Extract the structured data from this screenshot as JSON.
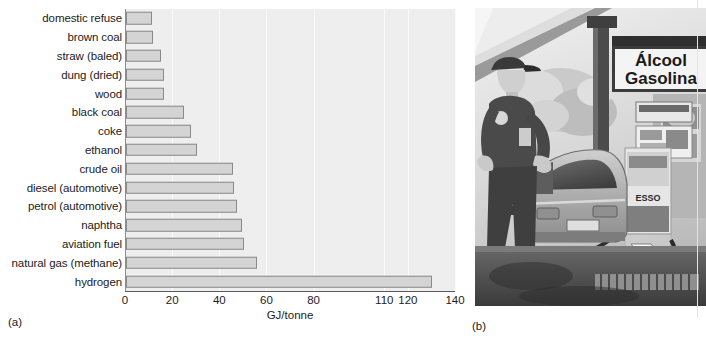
{
  "figure": {
    "panel_a_label": "(a)",
    "panel_b_label": "(b)"
  },
  "chart_data": {
    "type": "bar",
    "orientation": "horizontal",
    "title": "",
    "xlabel": "GJ/tonne",
    "ylabel": "",
    "xlim": [
      0,
      140
    ],
    "xticks": [
      0,
      20,
      40,
      60,
      80,
      110,
      120,
      140
    ],
    "xticklabels": [
      "0",
      "20",
      "40",
      "60",
      "80",
      "110",
      "120",
      "140"
    ],
    "grid": "vertical",
    "legend": "none",
    "bar_facecolor": "#d4d4d4",
    "bar_edgecolor": "#8a8a8a",
    "plot_background": "#eeeeee",
    "categories": [
      "domestic refuse",
      "brown coal",
      "straw (baled)",
      "dung (dried)",
      "wood",
      "black coal",
      "coke",
      "ethanol",
      "crude oil",
      "diesel (automotive)",
      "petrol (automotive)",
      "naphtha",
      "aviation fuel",
      "natural gas (methane)",
      "hydrogen"
    ],
    "values": [
      11,
      11.5,
      15,
      16,
      16,
      24.5,
      27.5,
      30,
      45.5,
      46,
      47,
      49,
      50,
      55.5,
      130
    ],
    "units": "GJ/tonne"
  },
  "photo": {
    "caption_sign_line1": "Álcool",
    "caption_sign_line2": "Gasolina",
    "pump_brand": "ESSO",
    "description": "attendant refuelling a car at a Brazilian service station"
  }
}
